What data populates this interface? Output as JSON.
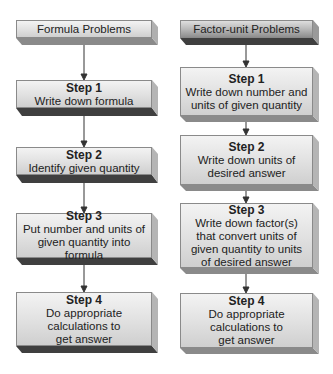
{
  "columns": [
    {
      "header": "Formula Problems",
      "steps": [
        {
          "title": "Step 1",
          "lines": [
            "Write down formula"
          ]
        },
        {
          "title": "Step 2",
          "lines": [
            "Identify given quantity"
          ]
        },
        {
          "title": "Step 3",
          "lines": [
            "Put number and units of",
            "given quantity into formula"
          ]
        },
        {
          "title": "Step 4",
          "lines": [
            "Do appropriate",
            "calculations to",
            "get answer"
          ]
        }
      ]
    },
    {
      "header": "Factor-unit Problems",
      "steps": [
        {
          "title": "Step 1",
          "lines": [
            "Write down number and",
            "units of given quantity"
          ]
        },
        {
          "title": "Step 2",
          "lines": [
            "Write down units of",
            "desired answer"
          ]
        },
        {
          "title": "Step 3",
          "lines": [
            "Write down factor(s)",
            "that convert units of",
            "given quantity to units",
            "of desired answer"
          ]
        },
        {
          "title": "Step 4",
          "lines": [
            "Do appropriate",
            "calculations to",
            "get answer"
          ]
        }
      ]
    }
  ],
  "colors": {
    "box_face_light": "#e2e2e2",
    "box_face_dark": "#b5b5b5",
    "box_shadow": "#3d3d3d",
    "arrow": "#333333"
  }
}
